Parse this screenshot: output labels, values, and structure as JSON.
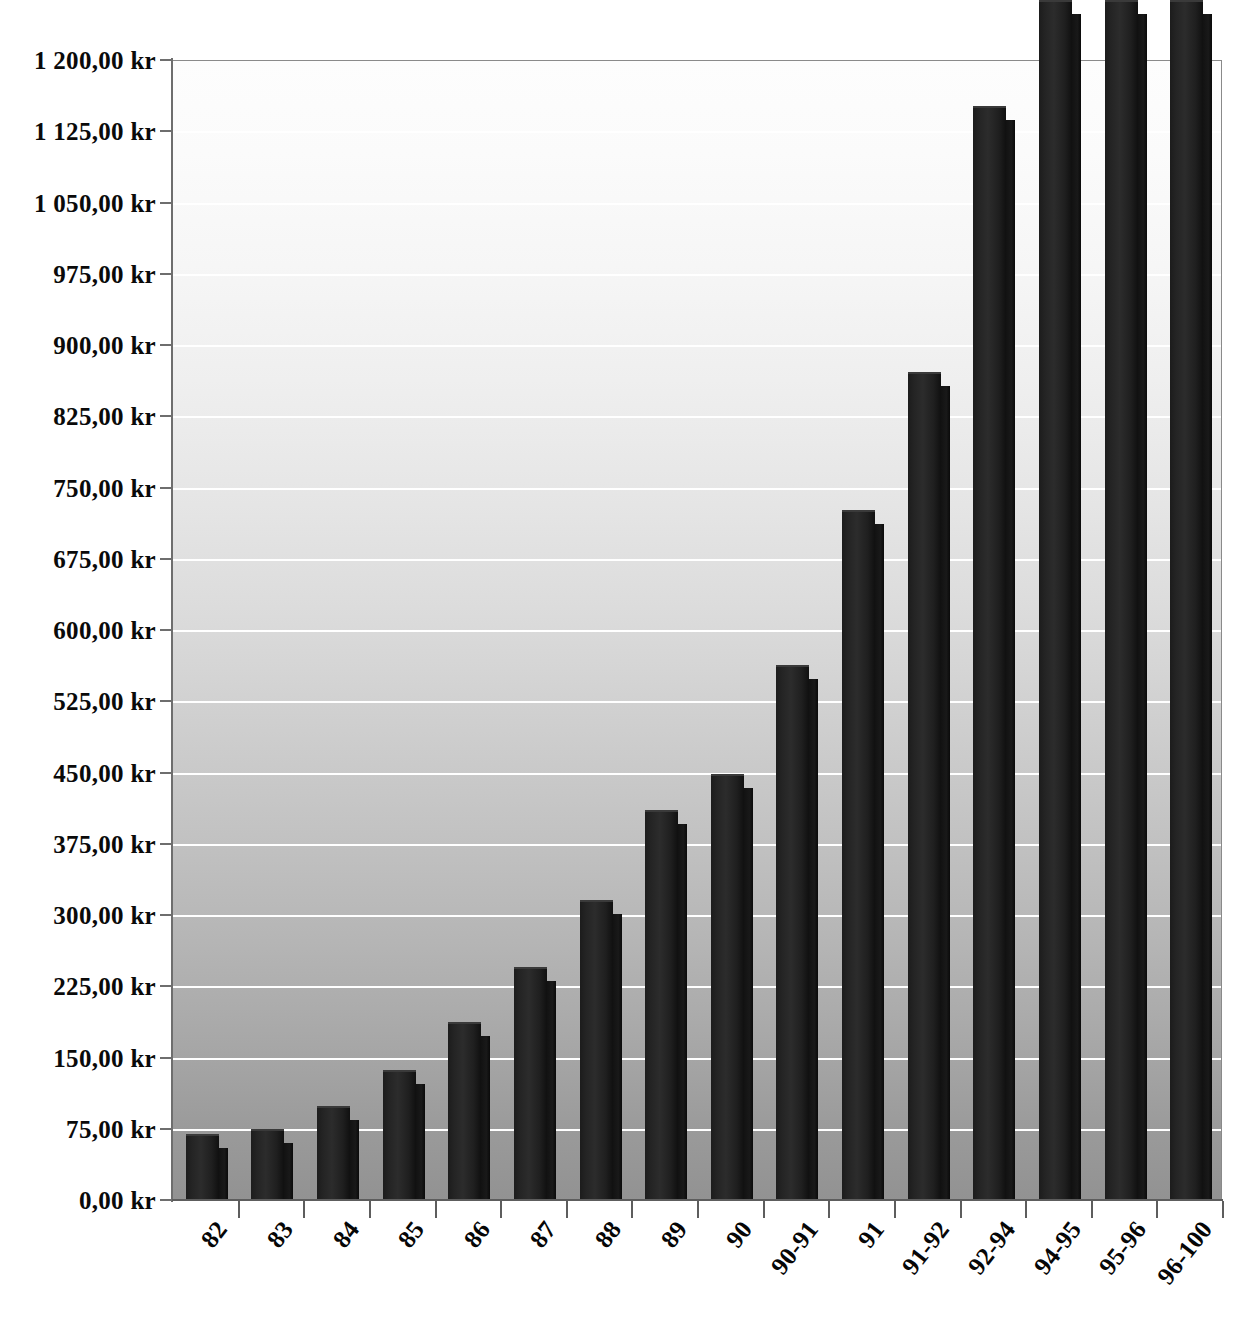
{
  "chart_data": {
    "type": "bar",
    "title": "",
    "subtitle": "",
    "xlabel": "",
    "ylabel": "",
    "currency_suffix": "kr",
    "categories": [
      "82",
      "83",
      "84",
      "85",
      "86",
      "87",
      "88",
      "89",
      "90",
      "90-91",
      "91",
      "91-92",
      "92-94",
      "94-95",
      "95-96",
      "96-100"
    ],
    "values": [
      70.0,
      75.0,
      99.0,
      137.0,
      187.0,
      245.0,
      316.0,
      411.0,
      448.0,
      563.0,
      726.0,
      872.0,
      1152.0,
      1263.0,
      1263.0,
      1263.0
    ],
    "clipped_above_axis": [
      false,
      false,
      false,
      false,
      false,
      false,
      false,
      false,
      false,
      false,
      false,
      false,
      false,
      true,
      true,
      true
    ],
    "ylim": [
      0,
      1200
    ],
    "ytick_values": [
      0,
      75,
      150,
      225,
      300,
      375,
      450,
      525,
      600,
      675,
      750,
      825,
      900,
      975,
      1050,
      1125,
      1200
    ],
    "ytick_labels": [
      "0,00 kr",
      "75,00 kr",
      "150,00 kr",
      "225,00 kr",
      "300,00 kr",
      "375,00 kr",
      "450,00 kr",
      "525,00 kr",
      "600,00 kr",
      "675,00 kr",
      "750,00 kr",
      "825,00 kr",
      "900,00 kr",
      "975,00 kr",
      "1 050,00 kr",
      "1 125,00 kr",
      "1 200,00 kr"
    ],
    "grid": true,
    "gridline_color": "#ffffff",
    "legend": null,
    "bar_color": "#1f1f1f",
    "plot_background": "vertical gradient white to gray",
    "series": [
      {
        "name": "",
        "values": [
          70.0,
          75.0,
          99.0,
          137.0,
          187.0,
          245.0,
          316.0,
          411.0,
          448.0,
          563.0,
          726.0,
          872.0,
          1152.0,
          1263.0,
          1263.0,
          1263.0
        ]
      }
    ]
  },
  "caption": {
    "text": ""
  }
}
